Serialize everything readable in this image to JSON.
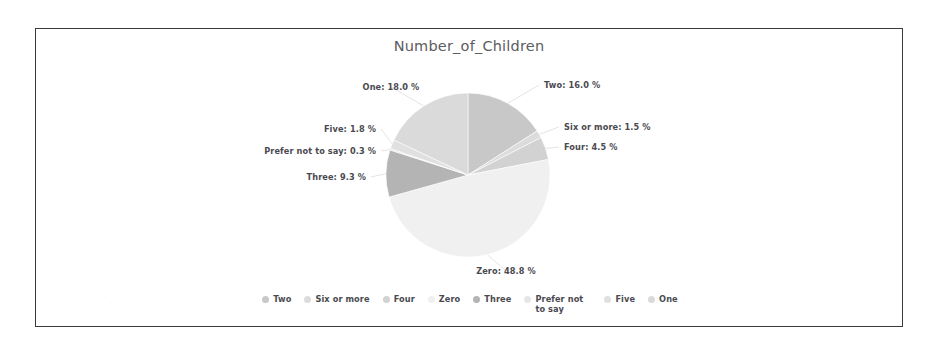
{
  "frame": {
    "border_color": "#3a3a3e",
    "background": "#ffffff"
  },
  "chart_data": {
    "type": "pie",
    "title": "Number_of_Children",
    "xlabel": "",
    "ylabel": "",
    "legend_position": "bottom",
    "grid": false,
    "categories": [
      "Two",
      "Six or more",
      "Four",
      "Zero",
      "Three",
      "Prefer not to say",
      "Five",
      "One"
    ],
    "values": [
      16.0,
      1.5,
      4.5,
      48.8,
      9.3,
      0.3,
      1.8,
      18.0
    ],
    "unit": "%",
    "colors": [
      "#c8c8c8",
      "#dcdcdc",
      "#d2d2d2",
      "#f0f0f0",
      "#b4b4b4",
      "#e6e6e6",
      "#e0e0e0",
      "#dadada"
    ],
    "slices": [
      {
        "name": "Two",
        "value": 16.0,
        "label": "Two: 16.0 %",
        "color": "#c8c8c8"
      },
      {
        "name": "Six or more",
        "value": 1.5,
        "label": "Six or more: 1.5 %",
        "color": "#dcdcdc"
      },
      {
        "name": "Four",
        "value": 4.5,
        "label": "Four: 4.5 %",
        "color": "#d2d2d2"
      },
      {
        "name": "Zero",
        "value": 48.8,
        "label": "Zero: 48.8 %",
        "color": "#f0f0f0"
      },
      {
        "name": "Three",
        "value": 9.3,
        "label": "Three: 9.3 %",
        "color": "#b4b4b4"
      },
      {
        "name": "Prefer not to say",
        "value": 0.3,
        "label": "Prefer not to say: 0.3 %",
        "color": "#e6e6e6"
      },
      {
        "name": "Five",
        "value": 1.8,
        "label": "Five: 1.8 %",
        "color": "#e0e0e0"
      },
      {
        "name": "One",
        "value": 18.0,
        "label": "One: 18.0 %",
        "color": "#dadada"
      }
    ]
  },
  "legend": {
    "items": [
      {
        "label": "Two",
        "color": "#c8c8c8"
      },
      {
        "label": "Six or more",
        "color": "#dcdcdc"
      },
      {
        "label": "Four",
        "color": "#d2d2d2"
      },
      {
        "label": "Zero",
        "color": "#f0f0f0"
      },
      {
        "label": "Three",
        "color": "#b4b4b4"
      },
      {
        "label": "Prefer not to say",
        "color": "#e6e6e6"
      },
      {
        "label": "Five",
        "color": "#e0e0e0"
      },
      {
        "label": "One",
        "color": "#dadada"
      }
    ]
  }
}
